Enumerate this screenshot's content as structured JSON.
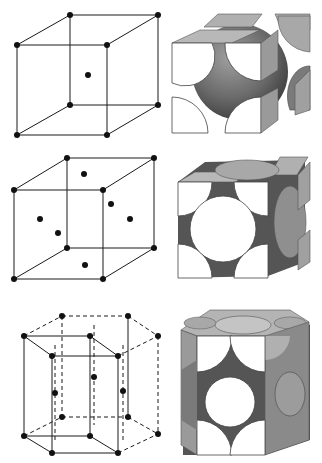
{
  "figure": {
    "rows": [
      {
        "id": "bcc",
        "structure": "body-centered cubic",
        "lattice_atoms": 9,
        "model_left": "lattice-points",
        "model_right": "hard-spheres"
      },
      {
        "id": "fcc",
        "structure": "face-centered cubic",
        "lattice_atoms": 14,
        "model_left": "lattice-points",
        "model_right": "hard-spheres"
      },
      {
        "id": "hcp",
        "structure": "hexagonal close-packed",
        "lattice_atoms": 15,
        "model_left": "lattice-points",
        "model_right": "hard-spheres"
      }
    ]
  },
  "colors": {
    "background": "#ffffff",
    "line": "#1a1a1a",
    "atom": "#111111",
    "sphere_dark": "#4a4a4a",
    "sphere_mid": "#8c8c8c",
    "face_light": "#b8b8b8",
    "cut_face": "#ffffff"
  }
}
